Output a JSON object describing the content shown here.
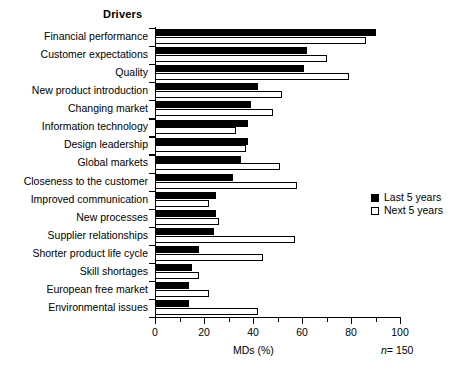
{
  "chart_data": {
    "type": "bar",
    "orientation": "horizontal",
    "title": "Drivers",
    "xlabel": "MDs (%)",
    "ylabel": "",
    "xlim": [
      0,
      100
    ],
    "xticks": [
      0,
      20,
      40,
      60,
      80,
      100
    ],
    "xtick_labels": [
      "0",
      "20",
      "40",
      "60",
      "80",
      "100"
    ],
    "minor_xticks": [
      10,
      30,
      50,
      70,
      90
    ],
    "grid": false,
    "legend_position": "center right",
    "annotation": "n = 150",
    "annotation_prefix": "n",
    "annotation_suffix": "= 150",
    "categories": [
      "Financial performance",
      "Customer expectations",
      "Quality",
      "New product introduction",
      "Changing market",
      "Information technology",
      "Design leadership",
      "Global markets",
      "Closeness to the customer",
      "Improved communication",
      "New processes",
      "Supplier relationships",
      "Shorter product life cycle",
      "Skill shortages",
      "European free market",
      "Environmental issues"
    ],
    "series": [
      {
        "name": "Last 5 years",
        "color": "#000000",
        "style": "filled",
        "values": [
          90,
          62,
          61,
          42,
          39,
          38,
          38,
          35,
          32,
          25,
          25,
          24,
          18,
          15,
          14,
          14
        ]
      },
      {
        "name": "Next 5 years",
        "color": "#ffffff",
        "style": "hollow",
        "values": [
          86,
          70,
          79,
          52,
          48,
          33,
          37,
          51,
          58,
          22,
          26,
          57,
          44,
          18,
          22,
          42
        ]
      }
    ]
  }
}
